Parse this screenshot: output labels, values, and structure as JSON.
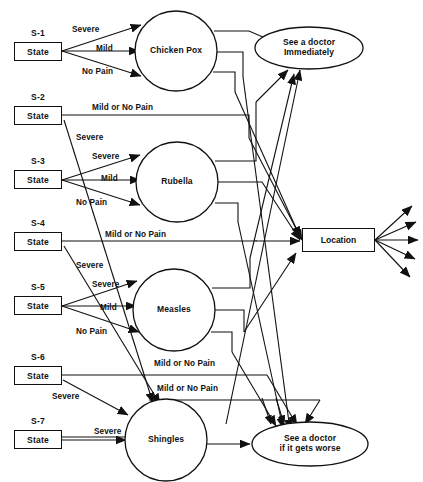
{
  "diagram": {
    "title_strip": "",
    "states": [
      {
        "id": "S-1",
        "label": "State",
        "x": 14,
        "y": 42,
        "w": 48,
        "h": 19
      },
      {
        "id": "S-2",
        "label": "State",
        "x": 14,
        "y": 106,
        "w": 48,
        "h": 19
      },
      {
        "id": "S-3",
        "label": "State",
        "x": 14,
        "y": 170,
        "w": 48,
        "h": 19
      },
      {
        "id": "S-4",
        "label": "State",
        "x": 14,
        "y": 232,
        "w": 48,
        "h": 19
      },
      {
        "id": "S-5",
        "label": "State",
        "x": 14,
        "y": 296,
        "w": 48,
        "h": 19
      },
      {
        "id": "S-6",
        "label": "State",
        "x": 14,
        "y": 366,
        "w": 48,
        "h": 19
      },
      {
        "id": "S-7",
        "label": "State",
        "x": 14,
        "y": 430,
        "w": 48,
        "h": 19
      }
    ],
    "disease_nodes": [
      {
        "name": "Chicken Pox",
        "cx": 176,
        "cy": 51,
        "rx": 41,
        "ry": 40
      },
      {
        "name": "Rubella",
        "cx": 177,
        "cy": 182,
        "rx": 41,
        "ry": 40
      },
      {
        "name": "Measles",
        "cx": 174,
        "cy": 310,
        "rx": 41,
        "ry": 41
      },
      {
        "name": "Shingles",
        "cx": 166,
        "cy": 440,
        "rx": 41,
        "ry": 41
      }
    ],
    "outcome_nodes": [
      {
        "name": "See a doctor Immediately",
        "line1": "See a doctor",
        "line2": "Immediately",
        "cx": 309,
        "cy": 48,
        "rx": 54,
        "ry": 21
      },
      {
        "name": "See a doctor if it gets worse",
        "line1": "See a doctor",
        "line2": "if it gets worse",
        "cx": 310,
        "cy": 444,
        "rx": 58,
        "ry": 22
      }
    ],
    "location_node": {
      "label": "Location",
      "x": 302,
      "y": 228,
      "w": 73,
      "h": 24
    },
    "edge_labels": [
      {
        "text": "Severe",
        "x": 72,
        "y": 25
      },
      {
        "text": "Mild",
        "x": 96,
        "y": 44
      },
      {
        "text": "No Pain",
        "x": 82,
        "y": 67
      },
      {
        "text": "Mild or No Pain",
        "x": 92,
        "y": 103
      },
      {
        "text": "Severe",
        "x": 76,
        "y": 133
      },
      {
        "text": "Severe",
        "x": 92,
        "y": 152
      },
      {
        "text": "Mild",
        "x": 101,
        "y": 174
      },
      {
        "text": "No Pain",
        "x": 76,
        "y": 198
      },
      {
        "text": "Mild or No Pain",
        "x": 105,
        "y": 230
      },
      {
        "text": "Severe",
        "x": 76,
        "y": 261
      },
      {
        "text": "Severe",
        "x": 92,
        "y": 280
      },
      {
        "text": "Mild",
        "x": 100,
        "y": 303
      },
      {
        "text": "No Pain",
        "x": 76,
        "y": 327
      },
      {
        "text": "Mild or No Pain",
        "x": 154,
        "y": 359
      },
      {
        "text": "Mild or No Pain",
        "x": 157,
        "y": 384
      },
      {
        "text": "Severe",
        "x": 52,
        "y": 392
      },
      {
        "text": "Severe",
        "x": 94,
        "y": 427
      }
    ],
    "icons": {
      "arrowhead": "solid-triangle-arrowhead"
    },
    "colors": {
      "stroke": "#111111",
      "fill": "#ffffff",
      "text": "#111111"
    }
  }
}
